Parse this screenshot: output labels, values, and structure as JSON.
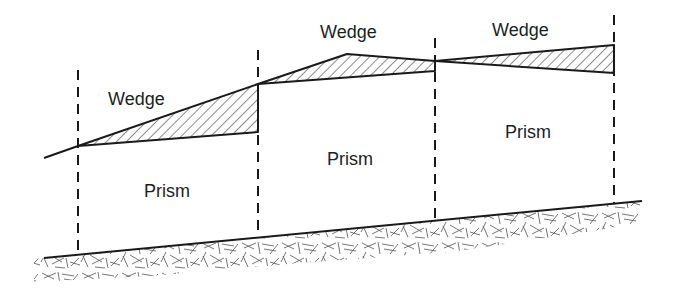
{
  "diagram": {
    "type": "earthwork-cross-section",
    "labels": {
      "wedge_1": "Wedge",
      "wedge_2": "Wedge",
      "wedge_3": "Wedge",
      "prism_1": "Prism",
      "prism_2": "Prism",
      "prism_3": "Prism"
    },
    "stations_x": [
      78,
      258,
      435,
      614
    ],
    "colors": {
      "line": "#1a1a1a",
      "text": "#1e1e1e",
      "background": "#ffffff"
    }
  }
}
